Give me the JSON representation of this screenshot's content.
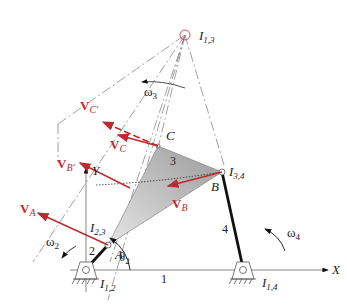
{
  "diagram": {
    "type": "four-bar linkage instant centers velocity diagram",
    "colors": {
      "velocity": "#c0282f",
      "link": "#111111",
      "construction": "#888888",
      "coupler_fill": "#b8b8b8"
    },
    "instant_centers": {
      "i13": {
        "label": "I",
        "sub": "1,3"
      },
      "i23": {
        "label": "I",
        "sub": "2,3"
      },
      "i34": {
        "label": "I",
        "sub": "3,4"
      },
      "i12": {
        "label": "I",
        "sub": "1,2"
      },
      "i14": {
        "label": "I",
        "sub": "1,4"
      }
    },
    "points": {
      "a": "A",
      "b": "B",
      "c": "C"
    },
    "links": {
      "l1": "1",
      "l2": "2",
      "l3": "3",
      "l4": "4"
    },
    "angles": {
      "omega2": "ω",
      "omega2_sub": "2",
      "omega3": "ω",
      "omega3_sub": "3",
      "omega4": "ω",
      "omega4_sub": "4",
      "theta2": "θ",
      "theta2_sub": "2"
    },
    "axes": {
      "x": "X",
      "y": "Y"
    },
    "velocities": {
      "va": {
        "v": "V",
        "sub": "A"
      },
      "vb": {
        "v": "V",
        "sub": "B"
      },
      "vc": {
        "v": "V",
        "sub": "C"
      },
      "vbp": {
        "v": "V",
        "sub": "B'"
      },
      "vcp": {
        "v": "V",
        "sub": "C'"
      }
    }
  }
}
